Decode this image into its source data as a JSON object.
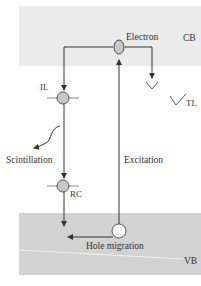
{
  "diagram": {
    "type": "energy-band-diagram",
    "bands": {
      "conduction": {
        "label": "CB",
        "color": "#ebebeb"
      },
      "valence": {
        "label": "VB",
        "color": "#d2d2d2"
      }
    },
    "states": {
      "electron": {
        "label": "Electron",
        "fill": "#c8c8c8"
      },
      "hole": {
        "label": "Hole migration",
        "fill": "#ffffff"
      },
      "il": {
        "label": "IL",
        "fill": "#c8c8c8"
      },
      "rc": {
        "label": "RC",
        "fill": "#c8c8c8"
      },
      "tl": {
        "label": "TL"
      }
    },
    "processes": {
      "scintillation": "Scintillation",
      "excitation": "Excitation"
    },
    "colors": {
      "line": "#333333",
      "text": "#333333"
    }
  }
}
